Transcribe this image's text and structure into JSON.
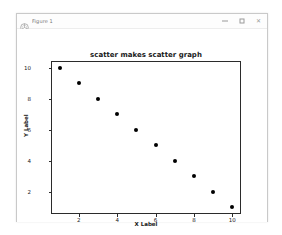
{
  "window": {
    "title": "Figure 1",
    "icon": "matplotlib-logo-icon",
    "controls": {
      "minimize_label": "—",
      "maximize_label": "□",
      "close_label": "✕"
    }
  },
  "chart_data": {
    "type": "scatter",
    "title": "scatter makes scatter graph",
    "xlabel": "X Label",
    "ylabel": "Y Label",
    "x": [
      1,
      2,
      3,
      4,
      5,
      6,
      7,
      8,
      9,
      10
    ],
    "y": [
      10,
      9,
      8,
      7,
      6,
      5,
      4,
      3,
      2,
      1
    ],
    "xlim": [
      0.55,
      10.45
    ],
    "ylim": [
      0.55,
      10.45
    ],
    "xticks": [
      2,
      4,
      6,
      8,
      10
    ],
    "xtick_labels": [
      "2",
      "4",
      "6",
      "8",
      "10"
    ],
    "yticks": [
      2,
      4,
      6,
      8,
      10
    ],
    "ytick_labels": [
      "2",
      "4",
      "6",
      "8",
      "10"
    ],
    "grid": false,
    "legend": null,
    "marker_color": "#000000",
    "axes_color": "#2b2b2b",
    "background": "#ffffff"
  }
}
